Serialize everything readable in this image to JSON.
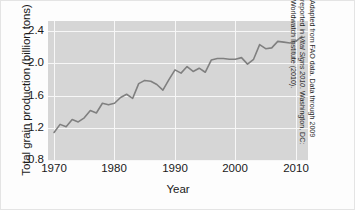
{
  "chart_data": {
    "type": "line",
    "title": "",
    "xlabel": "Year",
    "ylabel": "Total grain production (billion tons)",
    "xlim": [
      1969,
      2012
    ],
    "ylim": [
      0.8,
      2.52
    ],
    "xticks": [
      "1970",
      "1980",
      "1990",
      "2000",
      "2010"
    ],
    "xtick_values": [
      1970,
      1980,
      1990,
      2000,
      2010
    ],
    "yticks": [
      "0.8",
      "1.2",
      "1.6",
      "2.0",
      "2.4"
    ],
    "ytick_values": [
      0.8,
      1.2,
      1.6,
      2.0,
      2.4
    ],
    "grid": true,
    "legend": "none",
    "line_color": "#808080",
    "panel_color": "#d6d6d6",
    "grid_color": "#f7f7f7",
    "x": [
      1970,
      1971,
      1972,
      1973,
      1974,
      1975,
      1976,
      1977,
      1978,
      1979,
      1980,
      1981,
      1982,
      1983,
      1984,
      1985,
      1986,
      1987,
      1988,
      1989,
      1990,
      1991,
      1992,
      1993,
      1994,
      1995,
      1996,
      1997,
      1998,
      1999,
      2000,
      2001,
      2002,
      2003,
      2004,
      2005,
      2006,
      2007,
      2008,
      2009,
      2010,
      2011
    ],
    "values": [
      1.15,
      1.25,
      1.22,
      1.31,
      1.28,
      1.33,
      1.42,
      1.39,
      1.51,
      1.49,
      1.51,
      1.58,
      1.62,
      1.57,
      1.75,
      1.79,
      1.78,
      1.74,
      1.67,
      1.8,
      1.92,
      1.88,
      1.96,
      1.9,
      1.94,
      1.89,
      2.04,
      2.06,
      2.06,
      2.05,
      2.05,
      2.07,
      1.99,
      2.05,
      2.23,
      2.18,
      2.19,
      2.27,
      2.26,
      2.25,
      2.27,
      2.33
    ]
  },
  "axis": {
    "ylabel": "Total grain production (billion tons)",
    "xlabel": "Year",
    "yticks": [
      "2.4",
      "2.0",
      "1.6",
      "1.2",
      "0.8"
    ],
    "xticks": [
      "1970",
      "1980",
      "1990",
      "2000",
      "2010"
    ]
  },
  "source_note": {
    "line1_pre": "Adapted from FAO data. Data through 2009",
    "line2_pre": "reported in ",
    "line2_italic": "Vital Signs 2010",
    "line2_post": ". Washington, DC:",
    "line3": "Worldwatch Institute (2010)."
  }
}
